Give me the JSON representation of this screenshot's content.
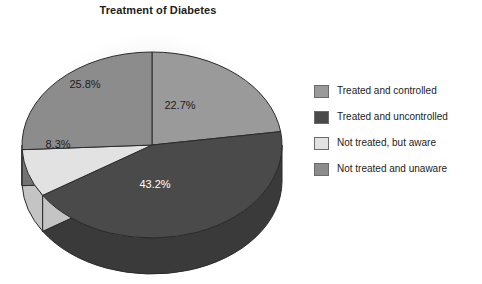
{
  "chart_data": {
    "type": "pie",
    "title": "Treatment of Diabetes",
    "subtitle": "",
    "xlabel": "",
    "ylabel": "",
    "legend_position": "right",
    "grid": false,
    "three_d": true,
    "categories": [
      "Treated and controlled",
      "Treated and uncontrolled",
      "Not treated, but aware",
      "Not treated and unaware"
    ],
    "values": [
      22.7,
      43.2,
      8.3,
      25.8
    ],
    "value_labels": [
      "22.7%",
      "43.2%",
      "8.3%",
      "25.8%"
    ],
    "colors": [
      "#9a9a9a",
      "#4a4a4a",
      "#e2e2e2",
      "#8c8c8c"
    ],
    "side_colors": [
      "#7d7d7d",
      "#3a3a3a",
      "#c4c4c4",
      "#737373"
    ],
    "label_text_colors": [
      "#1c1c1c",
      "#ffffff",
      "#1c1c1c",
      "#1c1c1c"
    ],
    "slices": [
      {
        "label": "Treated and controlled",
        "value": 22.7,
        "value_label": "22.7%",
        "color": "#9a9a9a",
        "side_color": "#7d7d7d",
        "label_color": "#1c1c1c"
      },
      {
        "label": "Treated and uncontrolled",
        "value": 43.2,
        "value_label": "43.2%",
        "color": "#4a4a4a",
        "side_color": "#3a3a3a",
        "label_color": "#ffffff"
      },
      {
        "label": "Not treated, but aware",
        "value": 8.3,
        "value_label": "8.3%",
        "color": "#e2e2e2",
        "side_color": "#c4c4c4",
        "label_color": "#1c1c1c"
      },
      {
        "label": "Not treated and unaware",
        "value": 25.8,
        "value_label": "25.8%",
        "color": "#8c8c8c",
        "side_color": "#737373",
        "label_color": "#1c1c1c"
      }
    ]
  },
  "title": "Treatment of Diabetes",
  "legend": {
    "items": [
      {
        "label": "Treated and controlled",
        "color": "#9a9a9a"
      },
      {
        "label": "Treated and uncontrolled",
        "color": "#4a4a4a"
      },
      {
        "label": "Not treated, but aware",
        "color": "#e2e2e2"
      },
      {
        "label": "Not treated and unaware",
        "color": "#8c8c8c"
      }
    ]
  },
  "slice_labels": {
    "s0": "22.7%",
    "s1": "43.2%",
    "s2": "8.3%",
    "s3": "25.8%"
  }
}
